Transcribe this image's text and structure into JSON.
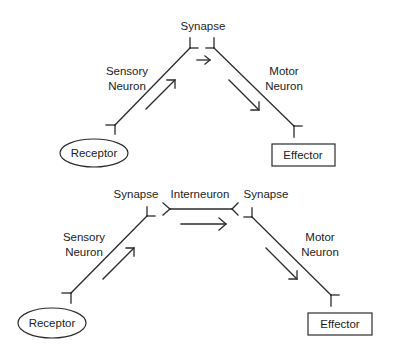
{
  "diagrams": [
    {
      "name": "reflex-arc-two-neuron",
      "labels": {
        "synapse": "Synapse",
        "sensory_line1": "Sensory",
        "sensory_line2": "Neuron",
        "motor_line1": "Motor",
        "motor_line2": "Neuron",
        "receptor": "Receptor",
        "effector": "Effector"
      }
    },
    {
      "name": "reflex-arc-three-neuron",
      "labels": {
        "synapse_left": "Synapse",
        "interneuron": "Interneuron",
        "synapse_right": "Synapse",
        "sensory_line1": "Sensory",
        "sensory_line2": "Neuron",
        "motor_line1": "Motor",
        "motor_line2": "Neuron",
        "receptor": "Receptor",
        "effector": "Effector"
      }
    }
  ],
  "colors": {
    "line": "#2b2b2b",
    "text": "#222222",
    "background": "#ffffff"
  }
}
